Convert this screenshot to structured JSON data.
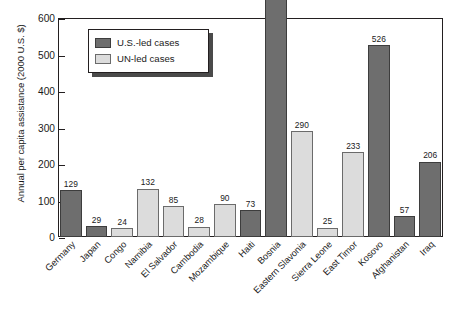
{
  "chart_data": {
    "type": "bar",
    "title": "",
    "xlabel": "",
    "ylabel": "Annual per capita assistance (2000 U.S. $)",
    "ylim": [
      0,
      600
    ],
    "yticks": [
      0,
      100,
      200,
      300,
      400,
      500,
      600
    ],
    "grid": false,
    "legend_position": "upper-left-inside",
    "categories": [
      "Germany",
      "Japan",
      "Congo",
      "Namibia",
      "El Salvador",
      "Cambodia",
      "Mozambique",
      "Haiti",
      "Bosnia",
      "Eastern Slavonia",
      "Sierra Leone",
      "East Timor",
      "Kosovo",
      "Afghanistan",
      "Iraq"
    ],
    "values": [
      129,
      29,
      24,
      132,
      85,
      28,
      90,
      73,
      679,
      290,
      25,
      233,
      526,
      57,
      206
    ],
    "groups": [
      "us",
      "us",
      "un",
      "un",
      "un",
      "un",
      "un",
      "us",
      "us",
      "un",
      "un",
      "un",
      "us",
      "us",
      "us"
    ],
    "series": [
      {
        "name": "U.S.-led cases",
        "key": "us",
        "color": "#6e6e6e",
        "points": [
          {
            "category": "Germany",
            "value": 129
          },
          {
            "category": "Japan",
            "value": 29
          },
          {
            "category": "Haiti",
            "value": 73
          },
          {
            "category": "Bosnia",
            "value": 679
          },
          {
            "category": "Kosovo",
            "value": 526
          },
          {
            "category": "Afghanistan",
            "value": 57
          },
          {
            "category": "Iraq",
            "value": 206
          }
        ]
      },
      {
        "name": "UN-led cases",
        "key": "un",
        "color": "#dcdcdc",
        "points": [
          {
            "category": "Congo",
            "value": 24
          },
          {
            "category": "Namibia",
            "value": 132
          },
          {
            "category": "El Salvador",
            "value": 85
          },
          {
            "category": "Cambodia",
            "value": 28
          },
          {
            "category": "Mozambique",
            "value": 90
          },
          {
            "category": "Eastern Slavonia",
            "value": 290
          },
          {
            "category": "Sierra Leone",
            "value": 25
          },
          {
            "category": "East Timor",
            "value": 233
          }
        ]
      }
    ],
    "annotations": [
      "Bosnia bar (679) exceeds the 600 axis maximum and extends above the plot frame."
    ]
  },
  "axis": {
    "y_title": "Annual per capita assistance (2000 U.S. $)",
    "tick_labels": [
      "600",
      "500",
      "400",
      "300",
      "200",
      "100",
      "0"
    ]
  },
  "legend": {
    "items": [
      {
        "label": "U.S.-led cases",
        "swatch": "us"
      },
      {
        "label": "UN-led cases",
        "swatch": "un"
      }
    ]
  }
}
